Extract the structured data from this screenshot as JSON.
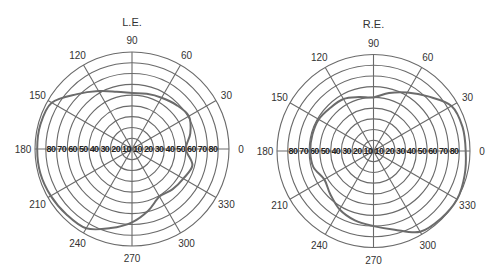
{
  "chart_data": [
    {
      "type": "polar-line",
      "title": "L.E.",
      "angular_ticks": [
        0,
        30,
        60,
        90,
        120,
        150,
        180,
        210,
        240,
        270,
        300,
        330
      ],
      "radial_ticks": [
        10,
        20,
        30,
        40,
        50,
        60,
        70,
        80
      ],
      "rmax": 90,
      "grid": true,
      "theta": [
        0,
        15,
        30,
        45,
        60,
        75,
        90,
        105,
        120,
        135,
        150,
        165,
        180,
        195,
        210,
        225,
        240,
        255,
        270,
        285,
        300,
        315,
        330,
        345
      ],
      "r": [
        50,
        56,
        61,
        58,
        55,
        53,
        52,
        55,
        62,
        72,
        86,
        88,
        88,
        88,
        87,
        86,
        85,
        76,
        68,
        59,
        51,
        53,
        55,
        58
      ]
    },
    {
      "type": "polar-line",
      "title": "R.E.",
      "angular_ticks": [
        0,
        30,
        60,
        90,
        120,
        150,
        180,
        210,
        240,
        270,
        300,
        330
      ],
      "radial_ticks": [
        10,
        20,
        30,
        40,
        50,
        60,
        70,
        80
      ],
      "rmax": 90,
      "grid": true,
      "theta": [
        0,
        15,
        30,
        45,
        60,
        75,
        90,
        105,
        120,
        135,
        150,
        165,
        180,
        195,
        210,
        225,
        240,
        255,
        270,
        285,
        300,
        315,
        330,
        345
      ],
      "r": [
        86,
        86,
        84,
        72,
        63,
        56,
        50,
        52,
        56,
        57,
        59,
        59,
        59,
        58,
        53,
        57,
        63,
        67,
        70,
        76,
        87,
        89,
        90,
        88
      ]
    }
  ],
  "charts": {
    "left": {
      "title": "L.E."
    },
    "right": {
      "title": "R.E."
    }
  },
  "style": {
    "grid_color": "#6a6a6a",
    "curve_color": "#6b6b6b"
  }
}
